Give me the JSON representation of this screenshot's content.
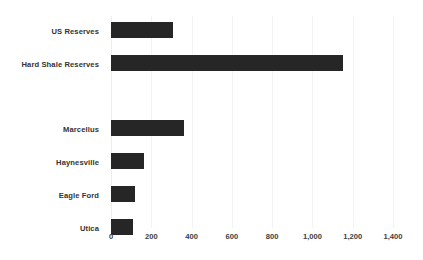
{
  "chart_data": {
    "type": "bar",
    "orientation": "horizontal",
    "title": "",
    "subtitle": "",
    "xlabel": "",
    "ylabel": "",
    "xlim": [
      0,
      1400
    ],
    "grid": true,
    "legend": false,
    "legend_position": "none",
    "bar_color": "#262626",
    "gridline_color": "#f3f3f3",
    "background_color": "#ffffff",
    "label_color": "#333333",
    "tick_color": "#404040",
    "xticks": [
      0,
      200,
      400,
      600,
      800,
      1000,
      1200,
      1400
    ],
    "xtick_labels": [
      "0",
      "200",
      "400",
      "600",
      "800",
      "1,000",
      "1,200",
      "1,400"
    ],
    "categories": [
      "US Reserves",
      "Hard Shale Reserves",
      "",
      "Marcellus",
      "Haynesville",
      "Eagle Ford",
      "Utica"
    ],
    "values": [
      310,
      1150,
      null,
      360,
      165,
      120,
      110
    ],
    "points": [
      {
        "category": "US Reserves",
        "value": 310
      },
      {
        "category": "Hard Shale Reserves",
        "value": 1150
      },
      {
        "category": "",
        "value": null
      },
      {
        "category": "Marcellus",
        "value": 360
      },
      {
        "category": "Haynesville",
        "value": 165
      },
      {
        "category": "Eagle Ford",
        "value": 120
      },
      {
        "category": "Utica",
        "value": 110
      }
    ]
  }
}
